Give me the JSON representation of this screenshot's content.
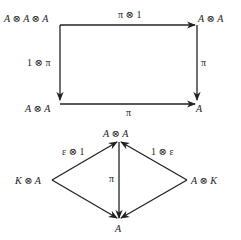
{
  "diagrams": [
    {
      "name": "associativity-square",
      "nodes": {
        "top_left": "A ⊗ A ⊗ A",
        "top_right": "A ⊗ A",
        "bottom_left": "A ⊗ A",
        "bottom_right": "A"
      },
      "edges": {
        "top": "π ⊗ 1",
        "left": "1 ⊗ π",
        "right": "π",
        "bottom": "π"
      }
    },
    {
      "name": "unit-diamond",
      "nodes": {
        "top": "A ⊗ A",
        "left": "K ⊗ A",
        "right": "A ⊗ K",
        "bottom": "A"
      },
      "edges": {
        "left_to_top": "ε ⊗ 1",
        "right_to_top": "1 ⊗ ε",
        "top_to_bottom": "π"
      }
    }
  ],
  "colors": {
    "ink": "#222222",
    "background": "#ffffff"
  }
}
